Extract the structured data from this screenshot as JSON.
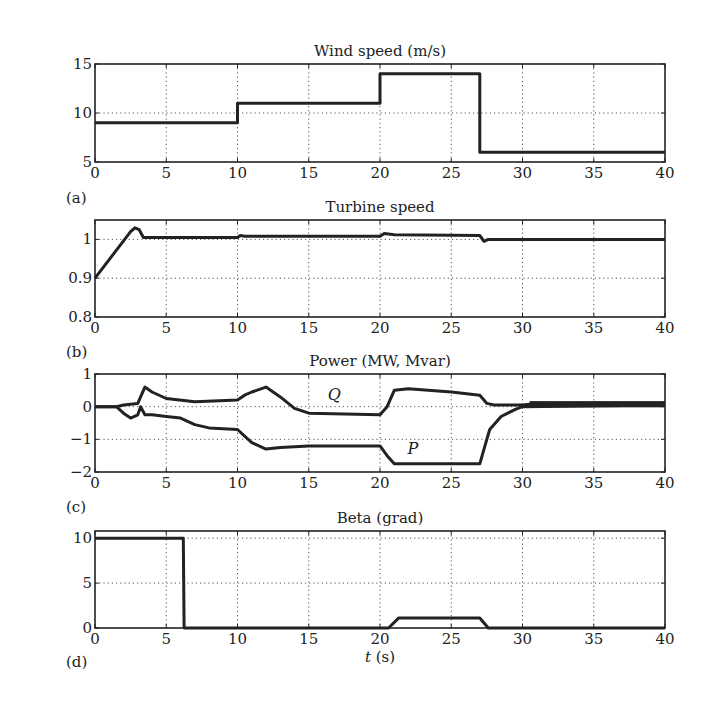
{
  "chart_data": [
    {
      "id": "a",
      "panel_label": "(a)",
      "type": "line",
      "title": "Wind speed (m/s)",
      "xlabel": "",
      "ylabel": "",
      "xlim": [
        0,
        40
      ],
      "ylim": [
        5,
        15
      ],
      "xticks": [
        0,
        5,
        10,
        15,
        20,
        25,
        30,
        35,
        40
      ],
      "yticks": [
        5,
        10,
        15
      ],
      "grid": true,
      "series": [
        {
          "name": "Wind speed",
          "x": [
            0,
            10,
            10,
            20,
            20,
            27,
            27,
            40
          ],
          "y": [
            9,
            9,
            11,
            11,
            14,
            14,
            6,
            6
          ]
        }
      ]
    },
    {
      "id": "b",
      "panel_label": "(b)",
      "type": "line",
      "title": "Turbine speed",
      "xlabel": "",
      "ylabel": "",
      "xlim": [
        0,
        40
      ],
      "ylim": [
        0.8,
        1.05
      ],
      "xticks": [
        0,
        5,
        10,
        15,
        20,
        25,
        30,
        35,
        40
      ],
      "yticks": [
        0.8,
        0.9,
        1
      ],
      "ytick_labels": [
        "0.8",
        "0.9",
        "1"
      ],
      "grid": true,
      "series": [
        {
          "name": "Turbine speed",
          "x": [
            0,
            2.5,
            2.8,
            3.1,
            3.4,
            10,
            10.2,
            10.5,
            12,
            20,
            20.3,
            21,
            27,
            27.3,
            27.6,
            40
          ],
          "y": [
            0.9,
            1.02,
            1.03,
            1.025,
            1.005,
            1.005,
            1.01,
            1.008,
            1.008,
            1.008,
            1.015,
            1.012,
            1.01,
            0.995,
            1.0,
            1.0
          ]
        }
      ]
    },
    {
      "id": "c",
      "panel_label": "(c)",
      "type": "line",
      "title": "Power (MW, Mvar)",
      "xlabel": "",
      "ylabel": "",
      "xlim": [
        0,
        40
      ],
      "ylim": [
        -2,
        1
      ],
      "xticks": [
        0,
        5,
        10,
        15,
        20,
        25,
        30,
        35,
        40
      ],
      "yticks": [
        -2,
        -1,
        0,
        1
      ],
      "ytick_labels": [
        "−2",
        "−1",
        "0",
        "1"
      ],
      "grid": true,
      "annotations": [
        {
          "text": "Q",
          "x": 16.8,
          "y": 0.2
        },
        {
          "text": "P",
          "x": 22.3,
          "y": -1.45
        }
      ],
      "series": [
        {
          "name": "Q",
          "x": [
            0,
            1.5,
            2,
            3,
            3.2,
            3.5,
            4,
            5,
            7,
            10,
            10.5,
            11,
            12,
            13,
            14,
            15,
            20,
            20.5,
            21,
            22,
            25,
            27,
            27.5,
            28,
            29,
            30,
            31,
            40
          ],
          "y": [
            0,
            0,
            0.05,
            0.1,
            0.3,
            0.6,
            0.45,
            0.25,
            0.15,
            0.2,
            0.35,
            0.45,
            0.6,
            0.3,
            -0.05,
            -0.2,
            -0.25,
            0.0,
            0.5,
            0.55,
            0.45,
            0.35,
            0.1,
            0.05,
            0.05,
            0.05,
            0.1,
            0.1
          ]
        },
        {
          "name": "P",
          "x": [
            0,
            1.5,
            2,
            2.5,
            3,
            3.2,
            3.5,
            4,
            5,
            6,
            7,
            8,
            10,
            10.5,
            11,
            12,
            13,
            15,
            20,
            20.5,
            21,
            23,
            27,
            27.3,
            27.7,
            28.5,
            29.5,
            30,
            40
          ],
          "y": [
            0,
            0,
            -0.2,
            -0.35,
            -0.25,
            0.0,
            -0.25,
            -0.25,
            -0.3,
            -0.35,
            -0.55,
            -0.65,
            -0.7,
            -0.9,
            -1.1,
            -1.3,
            -1.25,
            -1.2,
            -1.2,
            -1.5,
            -1.75,
            -1.75,
            -1.75,
            -1.3,
            -0.7,
            -0.3,
            -0.08,
            0.0,
            0.05
          ]
        }
      ]
    },
    {
      "id": "d",
      "panel_label": "(d)",
      "type": "line",
      "title": "Beta (grad)",
      "xlabel": "t (s)",
      "ylabel": "",
      "xlim": [
        0,
        40
      ],
      "ylim": [
        0,
        10.8
      ],
      "xticks": [
        0,
        5,
        10,
        15,
        20,
        25,
        30,
        35,
        40
      ],
      "yticks": [
        0,
        5,
        10
      ],
      "grid": true,
      "series": [
        {
          "name": "Beta",
          "x": [
            0,
            6.2,
            6.25,
            20.6,
            21.3,
            27,
            27.6,
            40
          ],
          "y": [
            10,
            10,
            0,
            0,
            1.1,
            1.1,
            0,
            0
          ]
        }
      ]
    }
  ],
  "figure": {
    "xlabel_italic": "t",
    "xlabel_unit": " (s)",
    "line_color": "#222222",
    "grid_color": "#555555"
  }
}
